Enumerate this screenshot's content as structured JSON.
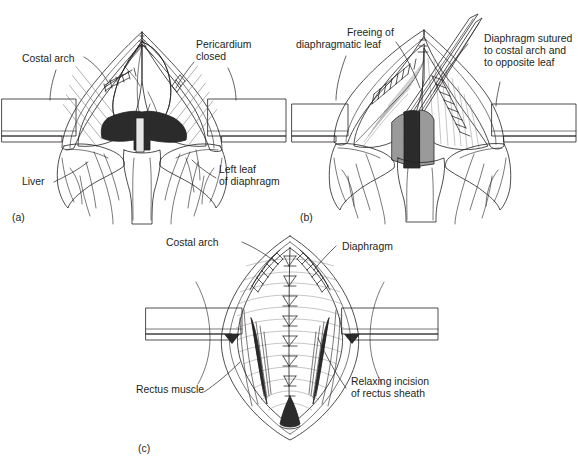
{
  "figure": {
    "background_color": "#ffffff",
    "ink_color": "#231f20",
    "panels": [
      {
        "id": "panel-a",
        "letter": "(a)",
        "labels": [
          {
            "name": "costal-arch",
            "lines": [
              "Costal arch"
            ]
          },
          {
            "name": "pericardium-closed",
            "lines": [
              "Pericardium",
              "closed"
            ]
          },
          {
            "name": "liver",
            "lines": [
              "Liver"
            ]
          },
          {
            "name": "left-leaf-of-diaphragm",
            "lines": [
              "Left leaf",
              "of diaphragm"
            ]
          }
        ]
      },
      {
        "id": "panel-b",
        "letter": "(b)",
        "labels": [
          {
            "name": "freeing-of-diaphragmatic-leaf",
            "lines": [
              "Freeing of",
              "diaphragmatic leaf"
            ]
          },
          {
            "name": "diaphragm-sutured",
            "lines": [
              "Diaphragm sutured",
              "to costal arch and",
              "to opposite leaf"
            ]
          }
        ]
      },
      {
        "id": "panel-c",
        "letter": "(c)",
        "labels": [
          {
            "name": "costal-arch",
            "lines": [
              "Costal arch"
            ]
          },
          {
            "name": "diaphragm",
            "lines": [
              "Diaphragm"
            ]
          },
          {
            "name": "rectus-muscle",
            "lines": [
              "Rectus muscle"
            ]
          },
          {
            "name": "relaxing-incision-of-rectus-sheath",
            "lines": [
              "Relaxing incision",
              "of rectus sheath"
            ]
          }
        ]
      }
    ],
    "text": {
      "a_letter": "(a)",
      "b_letter": "(b)",
      "c_letter": "(c)",
      "a_costal_arch": "Costal arch",
      "a_pericardium_1": "Pericardium",
      "a_pericardium_2": "closed",
      "a_liver": "Liver",
      "a_leftleaf_1": "Left leaf",
      "a_leftleaf_2": "of diaphragm",
      "b_freeing_1": "Freeing of",
      "b_freeing_2": "diaphragmatic leaf",
      "b_sutured_1": "Diaphragm sutured",
      "b_sutured_2": "to costal arch and",
      "b_sutured_3": "to opposite leaf",
      "c_costal_arch": "Costal arch",
      "c_diaphragm": "Diaphragm",
      "c_rectus_muscle": "Rectus muscle",
      "c_relaxing_1": "Relaxing incision",
      "c_relaxing_2": "of rectus sheath"
    }
  }
}
